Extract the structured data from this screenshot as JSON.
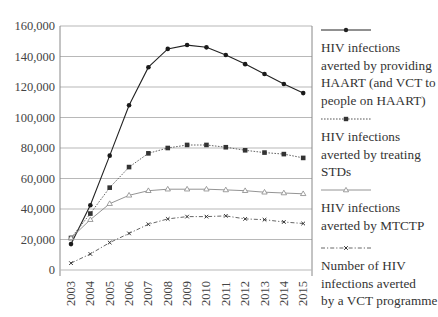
{
  "chart_data": {
    "type": "line",
    "title": "",
    "xlabel": "",
    "ylabel": "",
    "x": [
      2003,
      2004,
      2005,
      2006,
      2007,
      2008,
      2009,
      2010,
      2011,
      2012,
      2013,
      2014,
      2015
    ],
    "ylim": [
      0,
      160000
    ],
    "yticks": [
      0,
      20000,
      40000,
      60000,
      80000,
      100000,
      120000,
      140000,
      160000
    ],
    "ytick_labels": [
      "0",
      "20,000",
      "40,000",
      "60,000",
      "80,000",
      "100,000",
      "120,000",
      "140,000",
      "160,000"
    ],
    "xtick_labels": [
      "2003",
      "2004",
      "2005",
      "2006",
      "2007",
      "2008",
      "2009",
      "2010",
      "2011",
      "2012",
      "2013",
      "2014",
      "2015"
    ],
    "grid": "horizontal",
    "legend_position": "right",
    "series": [
      {
        "name": "HIV infections averted by providing HAART (and VCT to people on HAART)",
        "style": "solid",
        "marker": "circle",
        "values": [
          17000,
          42500,
          75000,
          108000,
          133000,
          145000,
          147500,
          146000,
          141000,
          135000,
          128500,
          122000,
          116000
        ]
      },
      {
        "name": "HIV infections averted by treating STDs",
        "style": "dotted",
        "marker": "square",
        "values": [
          21000,
          37000,
          54000,
          67500,
          76500,
          80000,
          82000,
          82000,
          80500,
          78500,
          77000,
          76000,
          73500
        ]
      },
      {
        "name": "HIV infections averted by MTCTP",
        "style": "solid-light",
        "marker": "triangle",
        "values": [
          21000,
          33000,
          43500,
          49000,
          52000,
          53000,
          53000,
          53000,
          52500,
          52000,
          51000,
          50500,
          50000
        ]
      },
      {
        "name": "Number of HIV infections averted by a VCT programme",
        "style": "dashdot",
        "marker": "x",
        "values": [
          4500,
          10500,
          18000,
          24000,
          30000,
          33500,
          35000,
          35000,
          35500,
          33500,
          33000,
          31500,
          30500
        ]
      }
    ]
  },
  "legend": {
    "items": [
      {
        "lines": [
          "HIV infections",
          "averted by providing",
          "HAART (and VCT to",
          "people on HAART)"
        ]
      },
      {
        "lines": [
          "HIV infections",
          "averted by treating",
          "STDs"
        ]
      },
      {
        "lines": [
          "HIV infections",
          "averted by MTCTP"
        ]
      },
      {
        "lines": [
          "Number of HIV",
          "infections averted",
          "by a VCT programme"
        ]
      }
    ]
  },
  "colors": {
    "line_dark": "#222222",
    "line_mid": "#555555",
    "line_light": "#888888",
    "grid": "#b8b8b8",
    "axis": "#888888",
    "text": "#444444"
  }
}
